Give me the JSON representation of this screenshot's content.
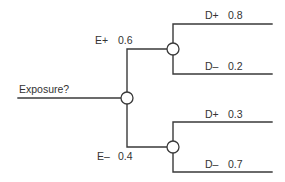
{
  "diagram": {
    "type": "decision-tree",
    "root": {
      "label": "Exposure?",
      "branches": [
        {
          "label": "E+",
          "probability": "0.6",
          "outcomes": [
            {
              "label": "D+",
              "probability": "0.8"
            },
            {
              "label": "D–",
              "probability": "0.2"
            }
          ]
        },
        {
          "label": "E–",
          "probability": "0.4",
          "outcomes": [
            {
              "label": "D+",
              "probability": "0.3"
            },
            {
              "label": "D–",
              "probability": "0.7"
            }
          ]
        }
      ]
    },
    "colors": {
      "line": "#3a3a3a",
      "text": "#333333",
      "node_fill": "#ffffff",
      "background": "#ffffff"
    }
  }
}
